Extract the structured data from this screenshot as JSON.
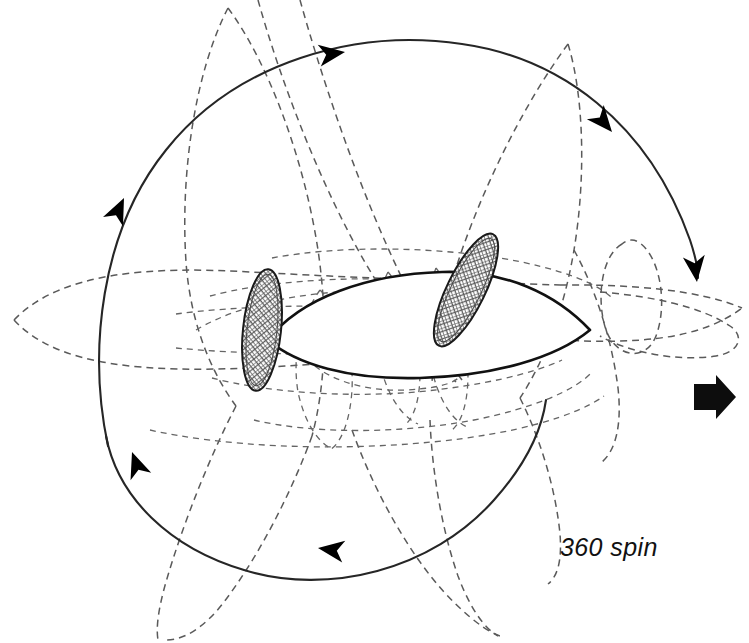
{
  "figure": {
    "title": "360 spin",
    "type": "technical-motion-diagram",
    "background_color": "#ffffff",
    "ink_color": "#111111",
    "ghost_color": "#5a5a5a"
  },
  "caption": {
    "text": "360 spin",
    "style": "italic",
    "x": 560,
    "y": 533
  },
  "travel_arrow": {
    "name": "direction-of-travel-arrow",
    "points": "right",
    "color": "#0d0d0d",
    "x": 692,
    "y": 390,
    "width": 42,
    "height": 30
  },
  "body": {
    "name": "lens-shaped-body",
    "description": "leaf/lens fuselage, blunt at left, pointed at right",
    "stroke": "#111111",
    "fill": "#ffffff",
    "left_x": 268,
    "right_tip_x": 590,
    "center_y": 318
  },
  "fins": [
    {
      "name": "fin-left",
      "fill_pattern": "cross-hatch",
      "tilt_degrees": 6,
      "center_x": 262,
      "center_y": 330,
      "length": 120,
      "width": 38
    },
    {
      "name": "fin-right",
      "fill_pattern": "cross-hatch",
      "tilt_degrees": 26,
      "center_x": 466,
      "center_y": 290,
      "length": 122,
      "width": 38
    }
  ],
  "solid_arcs": [
    {
      "name": "upper-rotation-arc",
      "direction": "clockwise",
      "arrowheads": 3
    },
    {
      "name": "lower-rotation-arc",
      "direction": "counter-clockwise",
      "arrowheads": 2
    }
  ],
  "arrowheads": [
    {
      "name": "arrowhead-top",
      "x": 345,
      "y": 52,
      "points": "right"
    },
    {
      "name": "arrowhead-upper-right",
      "x": 608,
      "y": 128,
      "points": "down-right"
    },
    {
      "name": "arrowhead-right-terminal",
      "x": 690,
      "y": 272,
      "points": "down"
    },
    {
      "name": "arrowhead-left-upper",
      "x": 120,
      "y": 205,
      "points": "up-right"
    },
    {
      "name": "arrowhead-left-lower",
      "x": 134,
      "y": 455,
      "points": "up-left"
    },
    {
      "name": "arrowhead-bottom",
      "x": 328,
      "y": 548,
      "points": "left"
    }
  ],
  "ghost_paths": {
    "name": "dashed-ghost-rotation-outlines",
    "style": "dashed",
    "count": 14,
    "description": "dashed ghost images of the body and fins at successive phases of the 360 degree rotation"
  }
}
